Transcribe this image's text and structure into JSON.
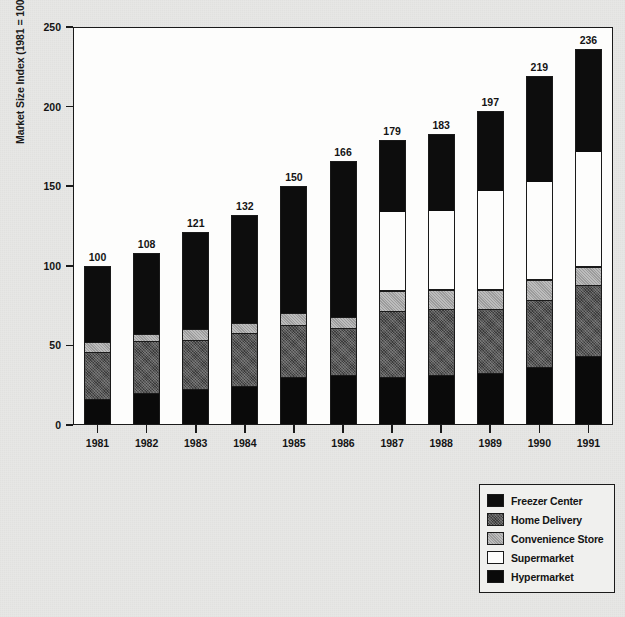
{
  "chart_data": {
    "type": "bar",
    "variant": "stacked-vertical",
    "title": "",
    "xlabel": "",
    "ylabel": "Market Size Index (1981 = 100)",
    "ylim": [
      0,
      250
    ],
    "yticks": [
      0,
      50,
      100,
      150,
      200,
      250
    ],
    "grid": false,
    "legend_position": "bottom-right",
    "categories": [
      "1981",
      "1982",
      "1983",
      "1984",
      "1985",
      "1986",
      "1987",
      "1988",
      "1989",
      "1990",
      "1991"
    ],
    "totals": [
      100,
      108,
      121,
      132,
      150,
      166,
      179,
      183,
      197,
      219,
      236
    ],
    "series": [
      {
        "name": "Hypermarket",
        "color": "#0a0a0a",
        "values": [
          16,
          20,
          22,
          24,
          30,
          31,
          30,
          31,
          32,
          36,
          43
        ]
      },
      {
        "name": "Home Delivery",
        "color": "#3b3b3b",
        "values": [
          29,
          32,
          31,
          33,
          32,
          29,
          41,
          41,
          40,
          42,
          44
        ]
      },
      {
        "name": "Convenience Store",
        "color": "#9c9c9c",
        "values": [
          7,
          5,
          7,
          7,
          8,
          8,
          13,
          13,
          13,
          13,
          12
        ]
      },
      {
        "name": "Supermarket",
        "color": "#fdfdfc",
        "values": [
          0,
          0,
          0,
          0,
          0,
          0,
          50,
          50,
          62,
          62,
          73
        ]
      },
      {
        "name": "Freezer Center",
        "color": "#0d0d0d",
        "values": [
          48,
          51,
          61,
          68,
          80,
          98,
          45,
          48,
          50,
          66,
          64
        ]
      }
    ]
  },
  "legend": {
    "items": [
      {
        "label": "Freezer Center",
        "swatch": "freezer"
      },
      {
        "label": "Home Delivery",
        "swatch": "home"
      },
      {
        "label": "Convenience Store",
        "swatch": "convenience"
      },
      {
        "label": "Supermarket",
        "swatch": "supermarket"
      },
      {
        "label": "Hypermarket",
        "swatch": "hyper"
      }
    ]
  }
}
